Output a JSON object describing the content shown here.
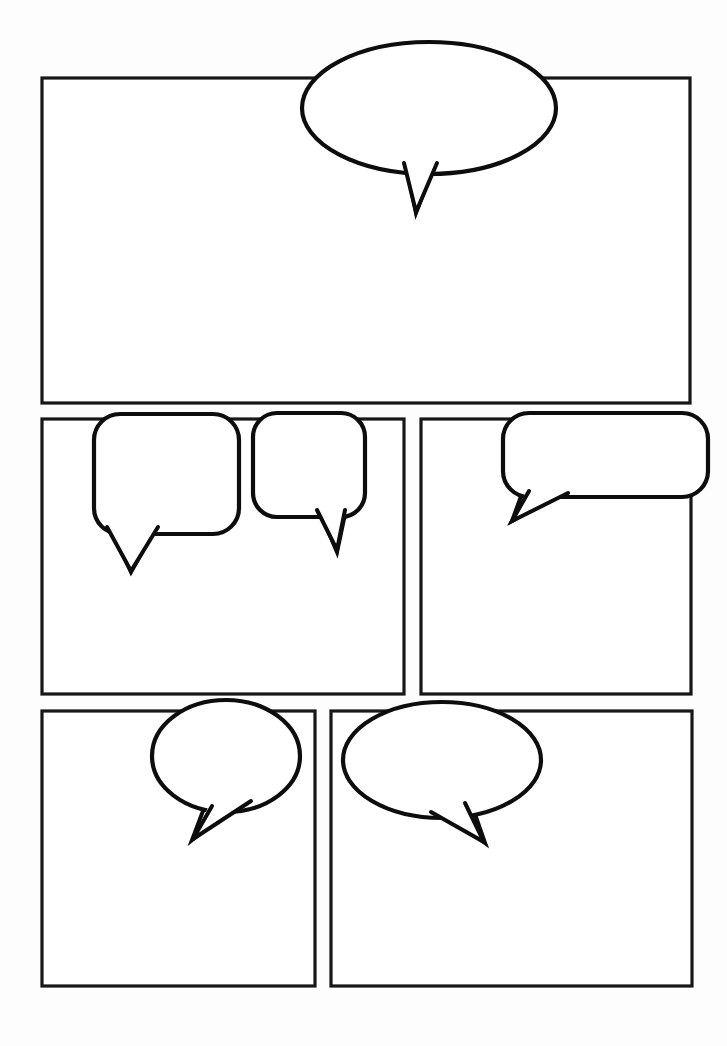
{
  "page": {
    "background_color": "#fdfdfd",
    "ink_color": "#0d0d0d",
    "panel_fill": "#ffffff",
    "width": 727,
    "height": 1046,
    "panel_count": 5,
    "balloon_count": 6,
    "rows": [
      {
        "name": "row-1",
        "panels": 1
      },
      {
        "name": "row-2",
        "panels": 2
      },
      {
        "name": "row-3",
        "panels": 2
      }
    ]
  },
  "panels": [
    {
      "id": "panel-1",
      "label": "Panel 1",
      "row": 1,
      "x": 42,
      "y": 78,
      "width": 648,
      "height": 325,
      "content": ""
    },
    {
      "id": "panel-2",
      "label": "Panel 2",
      "row": 2,
      "x": 42,
      "y": 419,
      "width": 362,
      "height": 275,
      "content": ""
    },
    {
      "id": "panel-3",
      "label": "Panel 3",
      "row": 2,
      "x": 421,
      "y": 419,
      "width": 270,
      "height": 275,
      "content": ""
    },
    {
      "id": "panel-4",
      "label": "Panel 4",
      "row": 3,
      "x": 42,
      "y": 711,
      "width": 273,
      "height": 275,
      "content": ""
    },
    {
      "id": "panel-5",
      "label": "Panel 5",
      "row": 3,
      "x": 331,
      "y": 711,
      "width": 361,
      "height": 275,
      "content": ""
    }
  ],
  "balloons": [
    {
      "id": "balloon-1",
      "label": "Speech Balloon 1",
      "shape": "ellipse",
      "in_panel": "panel-1",
      "text": "",
      "cx": 429,
      "cy": 108,
      "rx": 127,
      "ry": 66,
      "tail_direction": "down",
      "tail": "405,162 438,162 416,212"
    },
    {
      "id": "balloon-2",
      "label": "Speech Balloon 2",
      "shape": "rounded-rect",
      "in_panel": "panel-2",
      "text": "",
      "x": 94,
      "y": 414,
      "width": 145,
      "height": 120,
      "radius": 26,
      "tail_direction": "down-left",
      "tail": "107,526 160,526 131,571"
    },
    {
      "id": "balloon-3",
      "label": "Speech Balloon 3",
      "shape": "rounded-rect",
      "in_panel": "panel-2",
      "text": "",
      "x": 253,
      "y": 413,
      "width": 112,
      "height": 104,
      "radius": 24,
      "tail_direction": "down-right",
      "tail": "318,509 344,509 337,550"
    },
    {
      "id": "balloon-4",
      "label": "Speech Balloon 4",
      "shape": "rounded-rect",
      "in_panel": "panel-3",
      "text": "",
      "x": 503,
      "y": 413,
      "width": 205,
      "height": 84,
      "radius": 26,
      "tail_direction": "down-left",
      "tail": "530,487 566,491 514,520"
    },
    {
      "id": "balloon-5",
      "label": "Speech Balloon 5",
      "shape": "ellipse",
      "in_panel": "panel-4",
      "text": "",
      "cx": 226,
      "cy": 756,
      "rx": 74,
      "ry": 56,
      "tail_direction": "down-left",
      "tail": "212,805 249,801 194,838"
    },
    {
      "id": "balloon-6",
      "label": "Speech Balloon 6",
      "shape": "ellipse",
      "in_panel": "panel-5",
      "text": "",
      "cx": 442,
      "cy": 760,
      "rx": 99,
      "ry": 58,
      "tail_direction": "down-right",
      "tail": "431,811 463,804 483,841"
    }
  ]
}
